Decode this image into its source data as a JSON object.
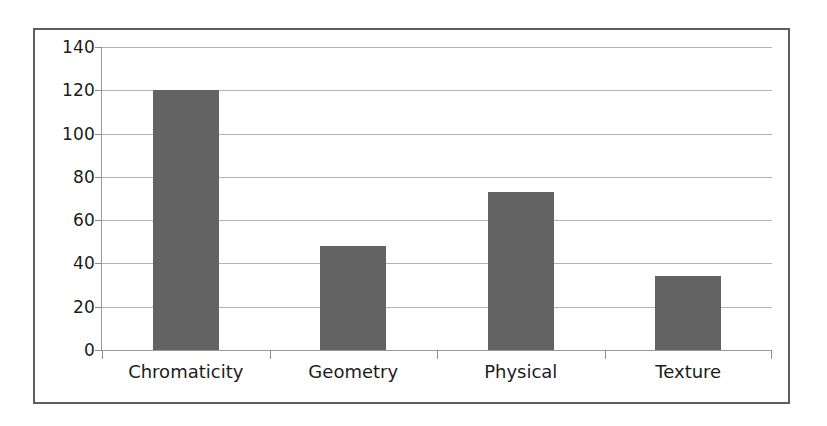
{
  "chart_data": {
    "type": "bar",
    "title": "",
    "subtitle": "",
    "xlabel": "",
    "ylabel": "",
    "categories": [
      "Chromaticity",
      "Geometry",
      "Physical",
      "Texture"
    ],
    "values": [
      120,
      48,
      73,
      34
    ],
    "ylim": [
      0,
      140
    ],
    "y_ticks": [
      0,
      20,
      40,
      60,
      80,
      100,
      120,
      140
    ],
    "y_tick_labels": [
      "0",
      "20",
      "40",
      "60",
      "80",
      "100",
      "120",
      "140"
    ],
    "grid": "horizontal",
    "legend": "none",
    "annotations": [],
    "colors": {
      "bar_fill": "#636363",
      "gridline": "#b4b4b4",
      "axis_line": "#9a9a9a",
      "frame_border": "#5d5d5d",
      "plot_background": "#ffffff",
      "page_background": "#ffffff",
      "tick_label": "#1c1c1c"
    }
  }
}
